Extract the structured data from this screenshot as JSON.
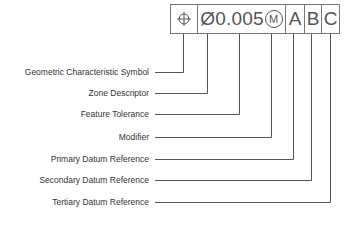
{
  "frame": {
    "symbol_icon": "position-symbol-icon",
    "zone_descriptor": "Ø",
    "tolerance": "0.005",
    "modifier": "M",
    "datums": [
      "A",
      "B",
      "C"
    ]
  },
  "labels": [
    {
      "text": "Geometric Characteristic Symbol",
      "y": 72,
      "x": 183
    },
    {
      "text": "Zone Descriptor",
      "y": 93,
      "x": 207
    },
    {
      "text": "Feature Tolerance",
      "y": 114,
      "x": 239
    },
    {
      "text": "Modifier",
      "y": 137,
      "x": 271
    },
    {
      "text": "Primary Datum Reference",
      "y": 159,
      "x": 293
    },
    {
      "text": "Secondary Datum Reference",
      "y": 180,
      "x": 311
    },
    {
      "text": "Tertiary Datum Reference",
      "y": 202,
      "x": 330
    }
  ],
  "colors": {
    "line": "#555555",
    "text": "#333333"
  }
}
